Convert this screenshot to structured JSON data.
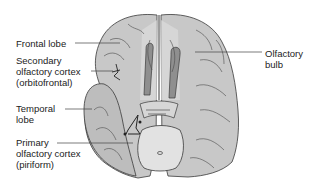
{
  "diagram": {
    "colors": {
      "brain_fill": "#c8c8c8",
      "brain_light": "#dedede",
      "outline": "#3a3a3a",
      "olfactory_tract": "#8f8f8f",
      "label_text": "#222222",
      "leader_line": "#444444"
    },
    "labels": [
      {
        "id": "frontal-lobe",
        "text": "Frontal lobe"
      },
      {
        "id": "secondary-olfactory-cortex",
        "text": "Secondary\nolfactory cortex\n(orbitofrontal)"
      },
      {
        "id": "temporal-lobe",
        "text": "Temporal\nlobe"
      },
      {
        "id": "primary-olfactory-cortex",
        "text": "Primary\nolfactory cortex\n(piriform)"
      },
      {
        "id": "olfactory-bulb",
        "text": "Olfactory\nbulb"
      }
    ]
  }
}
